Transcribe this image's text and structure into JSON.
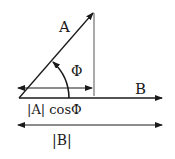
{
  "diagram": {
    "labels": {
      "vector_a": "A",
      "vector_b": "B",
      "angle": "Φ",
      "projection": "|A| cosΦ",
      "magnitude_b": "|B|"
    },
    "colors": {
      "stroke": "#1a1a1a",
      "reference_line": "#555555",
      "background": "#ffffff"
    }
  }
}
